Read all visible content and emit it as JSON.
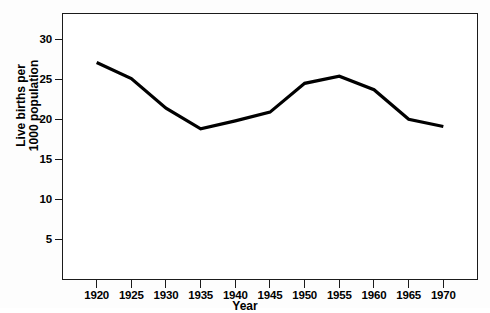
{
  "chart_data": {
    "type": "line",
    "title": "",
    "xlabel": "Year",
    "ylabel": "Live births per 1000 population",
    "ylabel_line1": "Live births per",
    "ylabel_line2": "1000 population",
    "x": [
      1920,
      1925,
      1930,
      1935,
      1940,
      1945,
      1950,
      1955,
      1960,
      1965,
      1970
    ],
    "values": [
      27.2,
      25.2,
      21.5,
      18.9,
      19.9,
      21.0,
      24.6,
      25.5,
      23.8,
      20.1,
      19.2
    ],
    "xtick_labels": [
      "1920",
      "1925",
      "1930",
      "1935",
      "1940",
      "1945",
      "1950",
      "1955",
      "1960",
      "1965",
      "1970"
    ],
    "ytick_labels": [
      "30",
      "25",
      "20",
      "15",
      "10",
      "5"
    ],
    "yticks": [
      30,
      25,
      20,
      15,
      10,
      5
    ],
    "xlim": [
      1915,
      1975
    ],
    "ylim": [
      0,
      33.4
    ],
    "grid": false,
    "legend": false,
    "line_color": "#000000",
    "line_width": 3,
    "frame_color": "#1b1b1b",
    "background_color": "#ffffff"
  }
}
